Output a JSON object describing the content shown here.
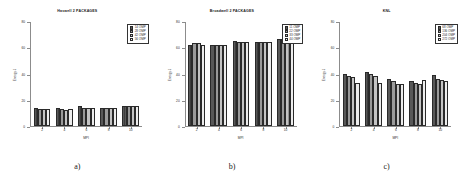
{
  "figure": {
    "panels": [
      {
        "letter": "a)",
        "title": "Haswell 2 PACKAGES",
        "legend": {
          "position": "top-right",
          "entries": [
            "14 OMP",
            "28 OMP",
            "42 OMP",
            "56 OMP"
          ]
        },
        "chart_data": {
          "type": "bar",
          "title": "Haswell 2 PACKAGES",
          "xlabel": "MPI",
          "ylabel": "Energy J",
          "categories": [
            "2",
            "4",
            "6",
            "8",
            "10"
          ],
          "yticks": [
            0,
            20,
            40,
            60,
            80
          ],
          "ylim": [
            0,
            80
          ],
          "grid": false,
          "legend_position": "top-right",
          "series": [
            {
              "name": "14 OMP",
              "values": [
                14,
                14,
                15,
                14,
                15
              ]
            },
            {
              "name": "28 OMP",
              "values": [
                13,
                13,
                14,
                14,
                15
              ]
            },
            {
              "name": "42 OMP",
              "values": [
                13,
                12,
                14,
                14,
                15
              ]
            },
            {
              "name": "56 OMP",
              "values": [
                13,
                13,
                14,
                14,
                15
              ]
            }
          ]
        }
      },
      {
        "letter": "b)",
        "title": "Broadwell 2 PACKAGES",
        "legend": {
          "position": "top-right",
          "entries": [
            "11 OMP",
            "22 OMP",
            "33 OMP",
            "44 OMP"
          ]
        },
        "chart_data": {
          "type": "bar",
          "title": "Broadwell 2 PACKAGES",
          "xlabel": "MPI",
          "ylabel": "Energy J",
          "categories": [
            "2",
            "4",
            "6",
            "8",
            "10"
          ],
          "yticks": [
            0,
            20,
            40,
            60,
            80
          ],
          "ylim": [
            0,
            80
          ],
          "grid": false,
          "legend_position": "top-right",
          "series": [
            {
              "name": "11 OMP",
              "values": [
                62,
                62,
                65,
                64,
                66
              ]
            },
            {
              "name": "22 OMP",
              "values": [
                63,
                62,
                64,
                64,
                66
              ]
            },
            {
              "name": "33 OMP",
              "values": [
                63,
                62,
                64,
                64,
                66
              ]
            },
            {
              "name": "44 OMP",
              "values": [
                62,
                62,
                64,
                64,
                66
              ]
            }
          ]
        }
      },
      {
        "letter": "c)",
        "title": "KNL",
        "legend": {
          "position": "top-right",
          "entries": [
            "68 OMP",
            "136 OMP",
            "204 OMP",
            "272 OMP"
          ]
        },
        "chart_data": {
          "type": "bar",
          "title": "KNL",
          "xlabel": "MPI",
          "ylabel": "Energy J",
          "categories": [
            "2",
            "4",
            "6",
            "8",
            "10"
          ],
          "yticks": [
            0,
            20,
            40,
            60,
            80
          ],
          "ylim": [
            0,
            80
          ],
          "grid": false,
          "legend_position": "top-right",
          "series": [
            {
              "name": "68 OMP",
              "values": [
                40,
                41,
                36,
                34,
                39
              ]
            },
            {
              "name": "136 OMP",
              "values": [
                38,
                40,
                34,
                33,
                36
              ]
            },
            {
              "name": "204 OMP",
              "values": [
                37,
                38,
                32,
                32,
                35
              ]
            },
            {
              "name": "272 OMP",
              "values": [
                33,
                33,
                32,
                35,
                34
              ]
            }
          ]
        }
      }
    ]
  }
}
